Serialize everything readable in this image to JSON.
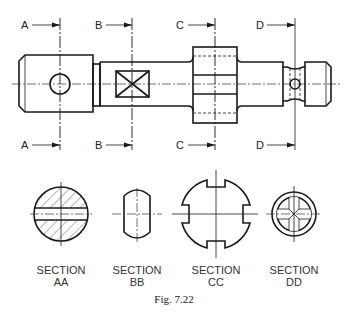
{
  "figure": {
    "caption": "Fig. 7.22",
    "type": "engineering drawing - shaft with cutting planes and sectional views"
  },
  "cutting_planes": [
    {
      "id": "A",
      "top_label": "A",
      "bottom_label": "A",
      "x": 60
    },
    {
      "id": "B",
      "top_label": "B",
      "bottom_label": "B",
      "x": 132
    },
    {
      "id": "C",
      "top_label": "C",
      "bottom_label": "C",
      "x": 215
    },
    {
      "id": "D",
      "top_label": "D",
      "bottom_label": "D",
      "x": 295
    }
  ],
  "sections": [
    {
      "id": "AA",
      "title": "SECTION",
      "name": "AA",
      "description": "round shaft with cross hole"
    },
    {
      "id": "BB",
      "title": "SECTION",
      "name": "BB",
      "description": "shaft with flats"
    },
    {
      "id": "CC",
      "title": "SECTION",
      "name": "CC",
      "description": "collar with four slots"
    },
    {
      "id": "DD",
      "title": "SECTION",
      "name": "DD",
      "description": "grooved section with cross holes"
    }
  ],
  "colors": {
    "line": "#1a1a1a",
    "background": "#ffffff"
  }
}
